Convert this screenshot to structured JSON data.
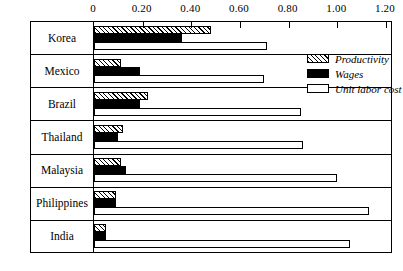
{
  "chart_data": {
    "type": "bar",
    "orientation": "horizontal",
    "title": "",
    "subtitle": "",
    "xlabel": "",
    "ylabel": "",
    "xlim": [
      0,
      1.2
    ],
    "grid": false,
    "legend_position": "top-right",
    "axis": {
      "tick_labels": [
        "0",
        "0.20",
        "0.40",
        "0.60",
        "0.80",
        "1.00",
        "1.20"
      ],
      "tick_values": [
        0,
        0.2,
        0.4,
        0.6,
        0.8,
        1.0,
        1.2
      ]
    },
    "categories": [
      "Korea",
      "Mexico",
      "Brazil",
      "Thailand",
      "Malaysia",
      "Philippines",
      "India"
    ],
    "series": [
      {
        "name": "Productivity",
        "pattern": "diagonal-hatch",
        "color": "#ffffff",
        "values": [
          0.48,
          0.11,
          0.22,
          0.12,
          0.11,
          0.09,
          0.05
        ]
      },
      {
        "name": "Wages",
        "pattern": "solid",
        "color": "#000000",
        "values": [
          0.36,
          0.19,
          0.19,
          0.1,
          0.13,
          0.09,
          0.05
        ]
      },
      {
        "name": "Unit labor cost",
        "pattern": "open",
        "color": "#ffffff",
        "values": [
          0.71,
          0.7,
          0.85,
          0.86,
          1.0,
          1.13,
          1.05
        ]
      }
    ]
  },
  "legend": {
    "items": [
      {
        "label": "Productivity",
        "swatch": "productivity"
      },
      {
        "label": "Wages",
        "swatch": "wages"
      },
      {
        "label": "Unit labor cost",
        "swatch": "ulc"
      }
    ]
  }
}
